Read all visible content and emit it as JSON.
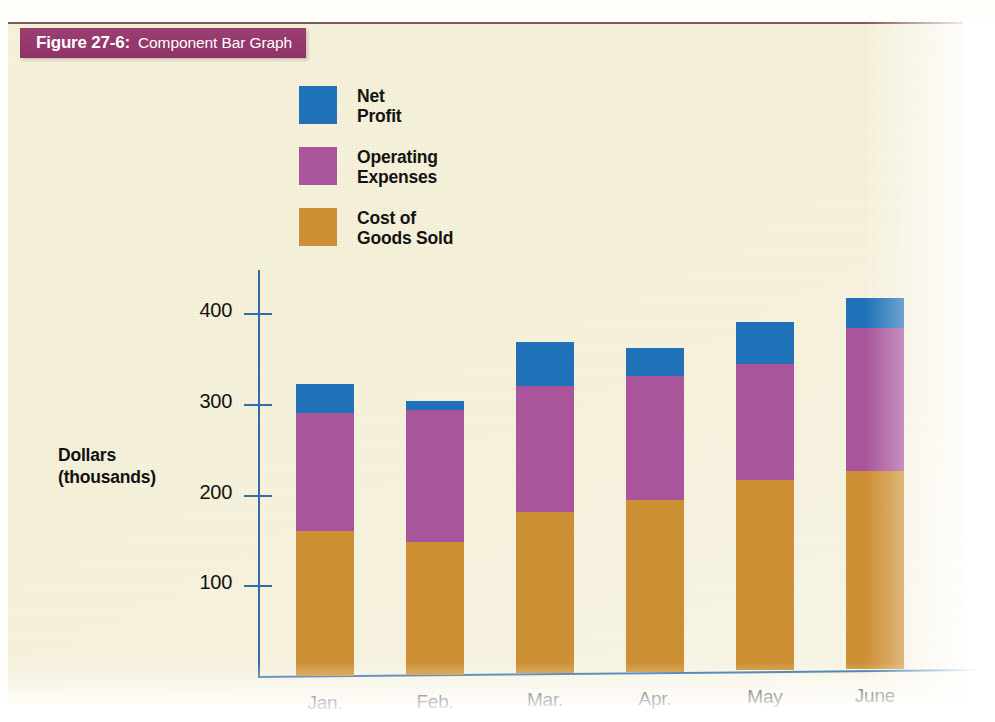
{
  "figure": {
    "caption_number": "Figure 27-6:",
    "caption_title": "Component Bar Graph"
  },
  "legend": {
    "items": [
      {
        "label": "Net\nProfit",
        "color": "#1f72b8",
        "key": "net_profit"
      },
      {
        "label": "Operating\nExpenses",
        "color": "#a8559b",
        "key": "operating_expenses"
      },
      {
        "label": "Cost of\nGoods Sold",
        "color": "#cd8f33",
        "key": "cost_of_goods_sold"
      }
    ]
  },
  "axes": {
    "y_title": "Dollars\n(thousands)",
    "y_ticks": [
      "100",
      "200",
      "300",
      "400"
    ],
    "x_ticks": [
      "Jan.",
      "Feb.",
      "Mar.",
      "Apr.",
      "May",
      "June"
    ],
    "axis_color": "#2f6ea8"
  },
  "chart_data": {
    "type": "bar",
    "stacked": true,
    "title": "Component Bar Graph",
    "xlabel": "",
    "ylabel": "Dollars (thousands)",
    "ylim": [
      0,
      430
    ],
    "ytick_values": [
      100,
      200,
      300,
      400
    ],
    "grid": false,
    "legend_position": "top-left",
    "categories": [
      "Jan.",
      "Feb.",
      "Mar.",
      "Apr.",
      "May",
      "June"
    ],
    "series": [
      {
        "name": "Cost of Goods Sold",
        "color": "#cd8f33",
        "values": [
          160,
          147,
          177,
          190,
          209,
          218
        ]
      },
      {
        "name": "Operating Expenses",
        "color": "#a8559b",
        "values": [
          130,
          145,
          139,
          136,
          128,
          158
        ]
      },
      {
        "name": "Net Profit",
        "color": "#1f72b8",
        "values": [
          32,
          10,
          49,
          31,
          47,
          33
        ]
      }
    ],
    "totals": [
      322,
      302,
      365,
      357,
      384,
      409
    ]
  }
}
